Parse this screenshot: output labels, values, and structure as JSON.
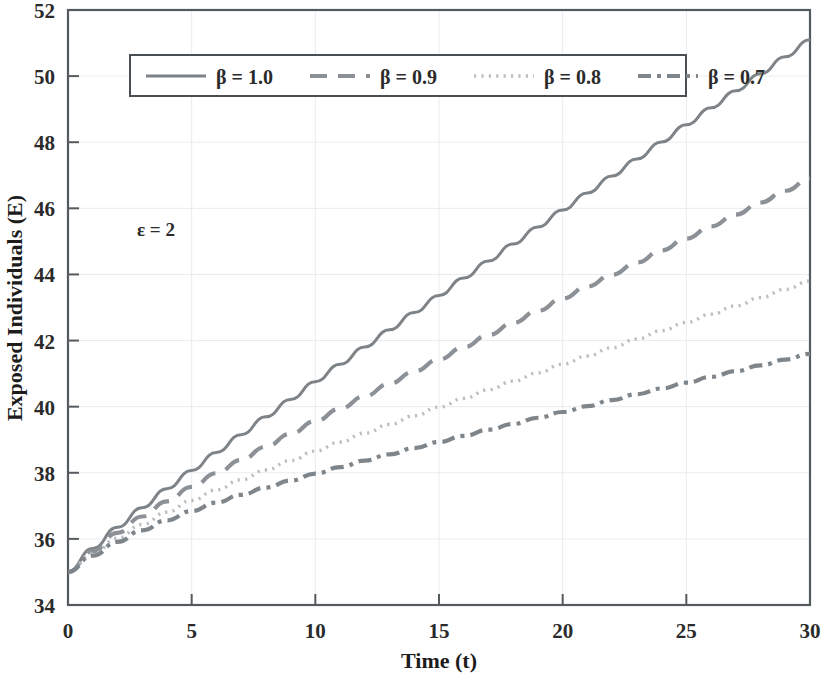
{
  "chart_data": {
    "type": "line",
    "title": "",
    "xlabel": "Time (t)",
    "ylabel": "Exposed Individuals (E)",
    "xlim": [
      0,
      30
    ],
    "ylim": [
      34,
      52
    ],
    "xticks": [
      0,
      5,
      10,
      15,
      20,
      25,
      30
    ],
    "yticks": [
      34,
      36,
      38,
      40,
      42,
      44,
      46,
      48,
      50,
      52
    ],
    "grid": true,
    "legend_position": "top-center",
    "annotations": [
      {
        "text": "ε = 2",
        "x": 3.2,
        "y": 45.4
      }
    ],
    "x": [
      0,
      1,
      2,
      3,
      4,
      5,
      6,
      7,
      8,
      9,
      10,
      11,
      12,
      13,
      14,
      15,
      16,
      17,
      18,
      19,
      20,
      21,
      22,
      23,
      24,
      25,
      26,
      27,
      28,
      29,
      30
    ],
    "series": [
      {
        "name": "β = 1.0",
        "style": "solid",
        "color": "#7d8387",
        "values": [
          35.0,
          35.62,
          36.18,
          36.7,
          37.2,
          37.68,
          38.16,
          38.63,
          39.1,
          39.56,
          40.03,
          40.49,
          40.95,
          41.4,
          41.86,
          42.31,
          42.77,
          43.22,
          43.67,
          44.12,
          44.57,
          45.02,
          45.47,
          45.92,
          46.37,
          46.82,
          47.27,
          47.72,
          48.17,
          48.62,
          49.07
        ]
      },
      {
        "name": "β = 0.9",
        "style": "dashed",
        "color": "#8b9196",
        "values": [
          35.0,
          35.55,
          36.03,
          36.46,
          36.86,
          37.24,
          37.6,
          37.95,
          38.3,
          38.64,
          38.97,
          39.3,
          39.63,
          39.96,
          40.28,
          40.6,
          40.92,
          41.24,
          41.56,
          41.88,
          42.2,
          42.52,
          42.83,
          43.15,
          43.47,
          43.78,
          44.1,
          44.41,
          44.73,
          45.04,
          45.36
        ]
      },
      {
        "name": "β = 0.8",
        "style": "dotted",
        "color": "#b9bec2",
        "values": [
          35.0,
          35.48,
          35.9,
          36.26,
          36.59,
          36.9,
          37.18,
          37.45,
          37.71,
          37.96,
          38.21,
          38.45,
          38.69,
          38.92,
          39.15,
          39.38,
          39.61,
          39.84,
          40.07,
          40.29,
          40.52,
          40.74,
          40.96,
          41.19,
          41.41,
          41.63,
          41.85,
          42.07,
          42.29,
          42.51,
          42.73
        ]
      },
      {
        "name": "β = 0.7",
        "style": "dashdot",
        "color": "#7f868b",
        "values": [
          35.0,
          35.42,
          35.78,
          36.08,
          36.34,
          36.58,
          36.8,
          37.0,
          37.19,
          37.37,
          37.55,
          37.72,
          37.89,
          38.05,
          38.21,
          38.37,
          38.53,
          38.69,
          38.84,
          39.0,
          39.15,
          39.3,
          39.46,
          39.61,
          39.76,
          39.91,
          40.06,
          40.21,
          40.36,
          40.51,
          40.66
        ]
      }
    ],
    "endpoints_at_t30": {
      "β = 1.0": 51.1,
      "β = 0.9": 46.9,
      "β = 0.8": 43.8,
      "β = 0.7": 41.6
    },
    "start_value": 35.0
  },
  "legend": {
    "entries": [
      {
        "label": "β = 1.0"
      },
      {
        "label": "β = 0.9"
      },
      {
        "label": "β = 0.8"
      },
      {
        "label": "β = 0.7"
      }
    ]
  },
  "axes": {
    "x_title": "Time (t)",
    "y_title": "Exposed Individuals (E)",
    "x_tick_labels": [
      "0",
      "5",
      "10",
      "15",
      "20",
      "25",
      "30"
    ],
    "y_tick_labels": [
      "34",
      "36",
      "38",
      "40",
      "42",
      "44",
      "46",
      "48",
      "50",
      "52"
    ]
  },
  "annotation": {
    "epsilon": "ε = 2"
  },
  "colors": {
    "frame": "#555a5e",
    "grid": "#e9ecef",
    "text": "#2b2b2b",
    "series_1": "#7d8387",
    "series_2": "#8b9196",
    "series_3": "#b9bec2",
    "series_4": "#7f868b"
  }
}
